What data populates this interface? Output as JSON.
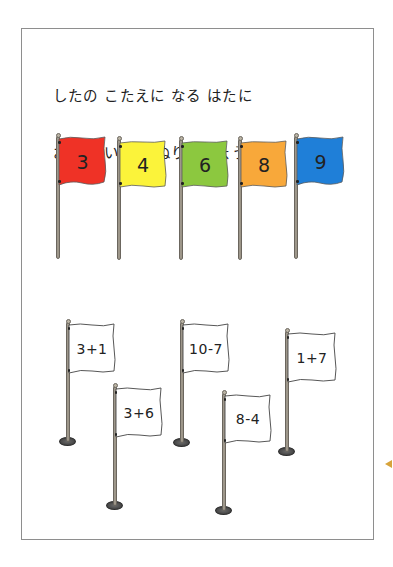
{
  "worksheet": {
    "instructions": [
      "したの こたえに なる はたに",
      "おなじ いろを ぬりましょう。"
    ]
  },
  "color_flags": [
    {
      "number": "3",
      "color": "#ef3226"
    },
    {
      "number": "4",
      "color": "#fbf33a"
    },
    {
      "number": "6",
      "color": "#8cc83f"
    },
    {
      "number": "8",
      "color": "#f8a83a"
    },
    {
      "number": "9",
      "color": "#1f7fd8"
    }
  ],
  "expression_flags": [
    {
      "expression": "3+1"
    },
    {
      "expression": "3+6"
    },
    {
      "expression": "10-7"
    },
    {
      "expression": "8-4"
    },
    {
      "expression": "1+7"
    }
  ],
  "colors": {
    "frame_border": "#8e8e8e",
    "page_marker": "#d7a33a",
    "expression_flag_fill": "#ffffff"
  }
}
